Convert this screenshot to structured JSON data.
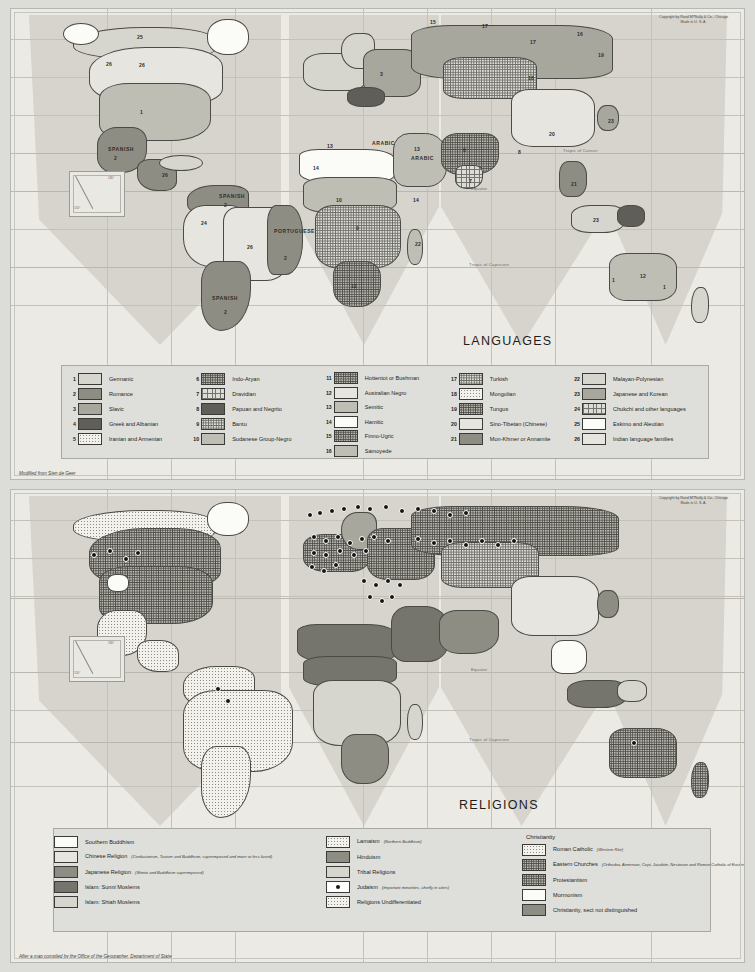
{
  "page": {
    "background_color": "#dcdcd8",
    "panel_color": "#e2e2de"
  },
  "maps": [
    {
      "id": "languages",
      "title": "LANGUAGES",
      "copyright_line1": "Copyright by Rand M?Nally & Co., Chicago",
      "copyright_line2": "Made in U. S. A.",
      "source_note": "Modified from Sten de Geer",
      "graticule_labels": {
        "equator": "Equator",
        "tropic_cancer": "Tropic of Cancer",
        "tropic_capricorn": "Tropic of Capricorn"
      },
      "map_labels": [
        {
          "text": "25",
          "x": 126,
          "y": 25
        },
        {
          "text": "26",
          "x": 95,
          "y": 52
        },
        {
          "text": "26",
          "x": 128,
          "y": 53
        },
        {
          "text": "1",
          "x": 129,
          "y": 100
        },
        {
          "text": "SPANISH",
          "x": 97,
          "y": 137
        },
        {
          "text": "2",
          "x": 103,
          "y": 146
        },
        {
          "text": "26",
          "x": 151,
          "y": 163
        },
        {
          "text": "SPANISH",
          "x": 208,
          "y": 184
        },
        {
          "text": "2",
          "x": 213,
          "y": 193
        },
        {
          "text": "24",
          "x": 190,
          "y": 211
        },
        {
          "text": "26",
          "x": 236,
          "y": 235
        },
        {
          "text": "PORTUGUESE",
          "x": 263,
          "y": 219
        },
        {
          "text": "2",
          "x": 273,
          "y": 246
        },
        {
          "text": "SPANISH",
          "x": 201,
          "y": 286
        },
        {
          "text": "2",
          "x": 213,
          "y": 300
        },
        {
          "text": "3",
          "x": 369,
          "y": 62
        },
        {
          "text": "15",
          "x": 419,
          "y": 10
        },
        {
          "text": "17",
          "x": 471,
          "y": 14
        },
        {
          "text": "17",
          "x": 519,
          "y": 30
        },
        {
          "text": "16",
          "x": 566,
          "y": 22
        },
        {
          "text": "19",
          "x": 587,
          "y": 43
        },
        {
          "text": "18",
          "x": 517,
          "y": 66
        },
        {
          "text": "13",
          "x": 316,
          "y": 134
        },
        {
          "text": "ARABIC",
          "x": 361,
          "y": 131
        },
        {
          "text": "13",
          "x": 403,
          "y": 137
        },
        {
          "text": "ARABIC",
          "x": 400,
          "y": 146
        },
        {
          "text": "14",
          "x": 302,
          "y": 156
        },
        {
          "text": "10",
          "x": 325,
          "y": 188
        },
        {
          "text": "9",
          "x": 345,
          "y": 216
        },
        {
          "text": "11",
          "x": 340,
          "y": 274
        },
        {
          "text": "22",
          "x": 404,
          "y": 232
        },
        {
          "text": "14",
          "x": 402,
          "y": 188
        },
        {
          "text": "6",
          "x": 452,
          "y": 138
        },
        {
          "text": "7",
          "x": 458,
          "y": 169
        },
        {
          "text": "8",
          "x": 507,
          "y": 140
        },
        {
          "text": "20",
          "x": 538,
          "y": 122
        },
        {
          "text": "21",
          "x": 560,
          "y": 172
        },
        {
          "text": "23",
          "x": 597,
          "y": 109
        },
        {
          "text": "23",
          "x": 582,
          "y": 208
        },
        {
          "text": "12",
          "x": 629,
          "y": 264
        },
        {
          "text": "1",
          "x": 652,
          "y": 275
        },
        {
          "text": "1",
          "x": 601,
          "y": 268
        }
      ],
      "legend_columns": [
        {
          "entries": [
            {
              "num": "1",
              "label": "Germanic",
              "fill": "f-l2"
            },
            {
              "num": "2",
              "label": "Romance",
              "fill": "f-d1"
            },
            {
              "num": "3",
              "label": "Slavic",
              "fill": "f-m2"
            },
            {
              "num": "4",
              "label": "Greek and Albanian",
              "fill": "f-d3"
            },
            {
              "num": "5",
              "label": "Iranian and Armenian",
              "fill": "f-dot-l"
            }
          ]
        },
        {
          "entries": [
            {
              "num": "6",
              "label": "Indo-Aryan",
              "fill": "f-dot-d"
            },
            {
              "num": "7",
              "label": "Dravidian",
              "fill": "f-cross"
            },
            {
              "num": "8",
              "label": "Papuan and Negrito",
              "fill": "f-d3"
            },
            {
              "num": "9",
              "label": "Bantu",
              "fill": "f-dot-m"
            },
            {
              "num": "10",
              "label": "Sudanese Group-Negro",
              "fill": "f-m1"
            }
          ]
        },
        {
          "entries": [
            {
              "num": "11",
              "label": "Hottentot or Bushman",
              "fill": "f-dot-d"
            },
            {
              "num": "12",
              "label": "Australian Negro",
              "fill": "f-l1"
            },
            {
              "num": "13",
              "label": "Semitic",
              "fill": "f-m1"
            },
            {
              "num": "14",
              "label": "Hamitic",
              "fill": "f-white"
            },
            {
              "num": "15",
              "label": "Finno-Ugric",
              "fill": "f-dot-d"
            },
            {
              "num": "16",
              "label": "Samoyede",
              "fill": "f-m1"
            }
          ]
        },
        {
          "entries": [
            {
              "num": "17",
              "label": "Turkish",
              "fill": "f-dot-m"
            },
            {
              "num": "18",
              "label": "Mongolian",
              "fill": "f-dot-l"
            },
            {
              "num": "19",
              "label": "Tungus",
              "fill": "f-dot-d"
            },
            {
              "num": "20",
              "label": "Sino-Tibetan (Chinese)",
              "fill": "f-l1"
            },
            {
              "num": "21",
              "label": "Mon-Khmer or Annamite",
              "fill": "f-d1"
            }
          ]
        },
        {
          "entries": [
            {
              "num": "22",
              "label": "Malayan-Polynesian",
              "fill": "f-l2"
            },
            {
              "num": "23",
              "label": "Japanese and Korean",
              "fill": "f-m2"
            },
            {
              "num": "24",
              "label": "Chukchi and other languages",
              "fill": "f-cross"
            },
            {
              "num": "25",
              "label": "Eskimo and Aleutian",
              "fill": "f-white"
            },
            {
              "num": "26",
              "label": "Indian language families",
              "fill": "f-l1"
            }
          ]
        }
      ]
    },
    {
      "id": "religions",
      "title": "RELIGIONS",
      "copyright_line1": "Copyright by Rand M?Nally & Co., Chicago",
      "copyright_line2": "Made in U. S. A.",
      "source_note": "After a map compiled by the Office of the Geographer, Department of State",
      "graticule_labels": {
        "equator": "Equator",
        "tropic_cancer": "Tropic of Cancer",
        "tropic_capricorn": "Tropic of Capricorn"
      },
      "legend_columns": [
        {
          "heading": "",
          "entries": [
            {
              "label": "Southern Buddhism",
              "note": "",
              "fill": "f-white"
            },
            {
              "label": "Chinese Religion",
              "note": "(Confucianism, Taoism and Buddhism, superimposed and more or less fused)",
              "fill": "f-l1"
            },
            {
              "label": "Japanese Religion",
              "note": "(Shinto and Buddhism superimposed)",
              "fill": "f-d1"
            },
            {
              "label": "Islam: Sunni Moslems",
              "note": "",
              "fill": "f-d2"
            },
            {
              "label": "Islam: Shiah Moslems",
              "note": "",
              "fill": "f-l2"
            }
          ]
        },
        {
          "heading": "",
          "entries": [
            {
              "label": "Lamaism",
              "note": "(Northern Buddhism)",
              "fill": "f-dot-l"
            },
            {
              "label": "Hinduism",
              "note": "",
              "fill": "f-d1"
            },
            {
              "label": "Tribal Religions",
              "note": "",
              "fill": "f-l2"
            },
            {
              "label": "Judaism",
              "note": "(Important minorities, chiefly in cities)",
              "fill": "judaism-dot"
            },
            {
              "label": "Religions Undifferentiated",
              "note": "",
              "fill": "f-dot-l"
            }
          ]
        },
        {
          "heading": "Christianity",
          "entries": [
            {
              "label": "Roman Catholic",
              "note": "(Western Rite)",
              "fill": "f-dot-l"
            },
            {
              "label": "Eastern Churches",
              "note": "(Orthodox, Armenian, Copt, Jacobite, Nestorian and Roman Catholic of Eastern Rites)",
              "fill": "f-dot-d"
            },
            {
              "label": "Protestantism",
              "note": "",
              "fill": "f-dot-d"
            },
            {
              "label": "Mormonism",
              "note": "",
              "fill": "f-white"
            },
            {
              "label": "Christianity, sect not distinguished",
              "note": "",
              "fill": "f-d1"
            }
          ]
        }
      ]
    }
  ]
}
